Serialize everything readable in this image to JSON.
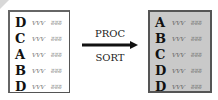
{
  "diagram": {
    "input_list": {
      "rows": [
        {
          "key": "D",
          "data1": "ѵѵѵ",
          "data2": "ʬʬʬ"
        },
        {
          "key": "C",
          "data1": "ѵѵѵ",
          "data2": "ʬʬʬ"
        },
        {
          "key": "A",
          "data1": "ѵѵѵ",
          "data2": "ʬʬʬ"
        },
        {
          "key": "B",
          "data1": "ѵѵѵ",
          "data2": "ʬʬʬ"
        },
        {
          "key": "D",
          "data1": "ѵѵѵ",
          "data2": "ʬʬʬ"
        }
      ]
    },
    "process": {
      "label_top": "PROC",
      "label_bottom": "SORT"
    },
    "output_list": {
      "rows": [
        {
          "key": "A",
          "data1": "ѵѵѵ",
          "data2": "ʬʬʬ"
        },
        {
          "key": "B",
          "data1": "ѵѵѵ",
          "data2": "ʬʬʬ"
        },
        {
          "key": "C",
          "data1": "ѵѵѵ",
          "data2": "ʬʬʬ"
        },
        {
          "key": "D",
          "data1": "ѵѵѵ",
          "data2": "ʬʬʬ"
        },
        {
          "key": "D",
          "data1": "ѵѵѵ",
          "data2": "ʬʬʬ"
        }
      ]
    },
    "colors": {
      "output_background": "#c9c9c9",
      "arrow": "#111111"
    }
  }
}
